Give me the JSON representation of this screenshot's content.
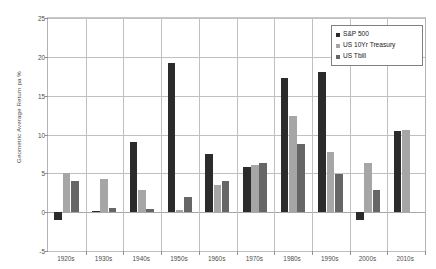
{
  "chart_data": {
    "type": "bar",
    "title": "",
    "xlabel": "",
    "ylabel": "Geometric Average Return pa %",
    "ylim": [
      -5,
      25
    ],
    "ytick_step": 5,
    "yticks": [
      25,
      20,
      15,
      10,
      5,
      0,
      -5
    ],
    "ytick_labels": [
      "25",
      "20",
      "15",
      "10",
      "5",
      "0",
      "-5"
    ],
    "grid": true,
    "legend_position": "top-right",
    "categories": [
      "1920s",
      "1930s",
      "1940s",
      "1950s",
      "1960s",
      "1970s",
      "1980s",
      "1990s",
      "2000s",
      "2010s"
    ],
    "series": [
      {
        "name": "S&P 500",
        "color": "#2b2b2b",
        "values": [
          -1.0,
          0.1,
          9.0,
          19.2,
          7.5,
          5.8,
          17.3,
          18.0,
          -1.0,
          10.5
        ]
      },
      {
        "name": "US 10Yr Treasury",
        "color": "#a6a6a6",
        "values": [
          5.0,
          4.3,
          2.9,
          0.3,
          3.5,
          6.1,
          12.4,
          7.7,
          6.3,
          10.6
        ]
      },
      {
        "name": "US Tbill",
        "color": "#666666",
        "values": [
          4.0,
          0.6,
          0.4,
          2.0,
          4.0,
          6.3,
          8.8,
          4.9,
          2.8,
          null
        ]
      }
    ]
  },
  "legend": {
    "items": [
      {
        "label": "S&P 500",
        "color": "#2b2b2b"
      },
      {
        "label": "US 10Yr Treasury",
        "color": "#a6a6a6"
      },
      {
        "label": "US Tbill",
        "color": "#666666"
      }
    ]
  },
  "axes": {
    "y_title": "Geometric Average Return pa %"
  }
}
